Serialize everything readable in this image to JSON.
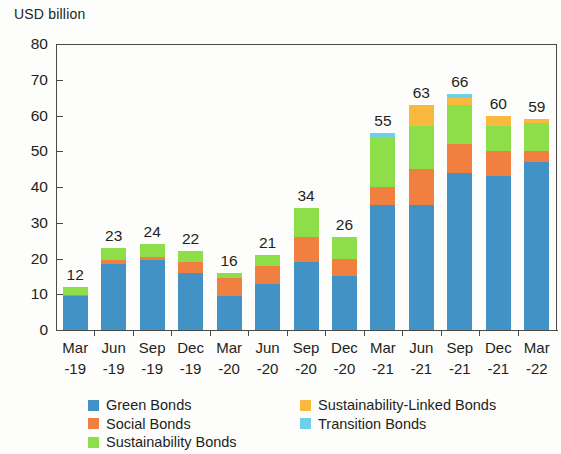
{
  "chart_data": {
    "type": "bar",
    "stacked": true,
    "title": "",
    "subtitle": "",
    "ylabel": "USD billion",
    "xlabel": "",
    "ylim": [
      0,
      80
    ],
    "yticks": [
      0,
      10,
      20,
      30,
      40,
      50,
      60,
      70,
      80
    ],
    "grid": false,
    "legend_position": "bottom",
    "categories": [
      "Mar\n-19",
      "Jun\n-19",
      "Sep\n-19",
      "Dec\n-19",
      "Mar\n-20",
      "Jun\n-20",
      "Sep\n-20",
      "Dec\n-20",
      "Mar\n-21",
      "Jun\n-21",
      "Sep\n-21",
      "Dec\n-21",
      "Mar\n-22"
    ],
    "category_lines": [
      [
        "Mar",
        "-19"
      ],
      [
        "Jun",
        "-19"
      ],
      [
        "Sep",
        "-19"
      ],
      [
        "Dec",
        "-19"
      ],
      [
        "Mar",
        "-20"
      ],
      [
        "Jun",
        "-20"
      ],
      [
        "Sep",
        "-20"
      ],
      [
        "Dec",
        "-20"
      ],
      [
        "Mar",
        "-21"
      ],
      [
        "Jun",
        "-21"
      ],
      [
        "Sep",
        "-21"
      ],
      [
        "Dec",
        "-21"
      ],
      [
        "Mar",
        "-22"
      ]
    ],
    "series": [
      {
        "name": "Green Bonds",
        "color": "#4292c6",
        "values": [
          9.5,
          18.5,
          19.5,
          16,
          9.5,
          13,
          19,
          15,
          35,
          35,
          44,
          43,
          47
        ]
      },
      {
        "name": "Social Bonds",
        "color": "#f07f40",
        "values": [
          0.3,
          1,
          1,
          3,
          5,
          5,
          7,
          5,
          5,
          10,
          8,
          7,
          3
        ]
      },
      {
        "name": "Sustainability Bonds",
        "color": "#8ede4a",
        "values": [
          2.2,
          3.5,
          3.5,
          3,
          1.5,
          3,
          8,
          6,
          14,
          12,
          11,
          7,
          8
        ]
      },
      {
        "name": "Sustainability-Linked Bonds",
        "color": "#f9b93f",
        "values": [
          0,
          0,
          0,
          0,
          0,
          0,
          0,
          0,
          0,
          6,
          2,
          3,
          1
        ]
      },
      {
        "name": "Transition Bonds",
        "color": "#6ecfe8",
        "values": [
          0,
          0,
          0,
          0,
          0,
          0,
          0,
          0,
          1,
          0,
          1,
          0,
          0
        ]
      }
    ],
    "totals": [
      12,
      23,
      24,
      22,
      16,
      21,
      34,
      26,
      55,
      63,
      66,
      60,
      59
    ],
    "data_labels": [
      "12",
      "23",
      "24",
      "22",
      "16",
      "21",
      "34",
      "26",
      "55",
      "63",
      "66",
      "60",
      "59"
    ]
  },
  "legend": {
    "column1": [
      {
        "label": "Green Bonds",
        "color": "#4292c6",
        "icon": "legend-swatch-icon"
      },
      {
        "label": "Social Bonds",
        "color": "#f07f40",
        "icon": "legend-swatch-icon"
      },
      {
        "label": "Sustainability Bonds",
        "color": "#8ede4a",
        "icon": "legend-swatch-icon"
      }
    ],
    "column2": [
      {
        "label": "Sustainability-Linked Bonds",
        "color": "#f9b93f",
        "icon": "legend-swatch-icon"
      },
      {
        "label": "Transition Bonds",
        "color": "#6ecfe8",
        "icon": "legend-swatch-icon"
      }
    ]
  },
  "colors": {
    "axis": "#4a4a48",
    "text": "#231f20",
    "background": "#fdfdfb"
  }
}
